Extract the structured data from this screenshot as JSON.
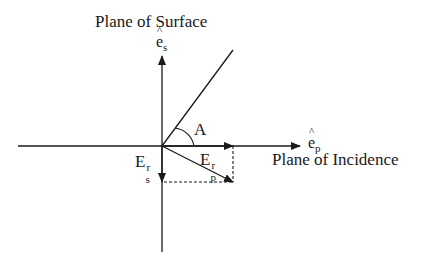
{
  "diagram": {
    "title_surface": "Plane of Surface",
    "title_incidence": "Plane of Incidence",
    "axis_s": {
      "base": "e",
      "subscript": "s",
      "hat": true
    },
    "axis_p": {
      "base": "e",
      "subscript": "p",
      "hat": true
    },
    "angle_label": "A",
    "vector_es": {
      "base": "E",
      "superscript": "r",
      "subscript": "s"
    },
    "vector_ep": {
      "base": "E",
      "superscript": "r",
      "subscript": "p"
    },
    "colors": {
      "ink": "#1a1a1a",
      "background": "#ffffff"
    }
  }
}
